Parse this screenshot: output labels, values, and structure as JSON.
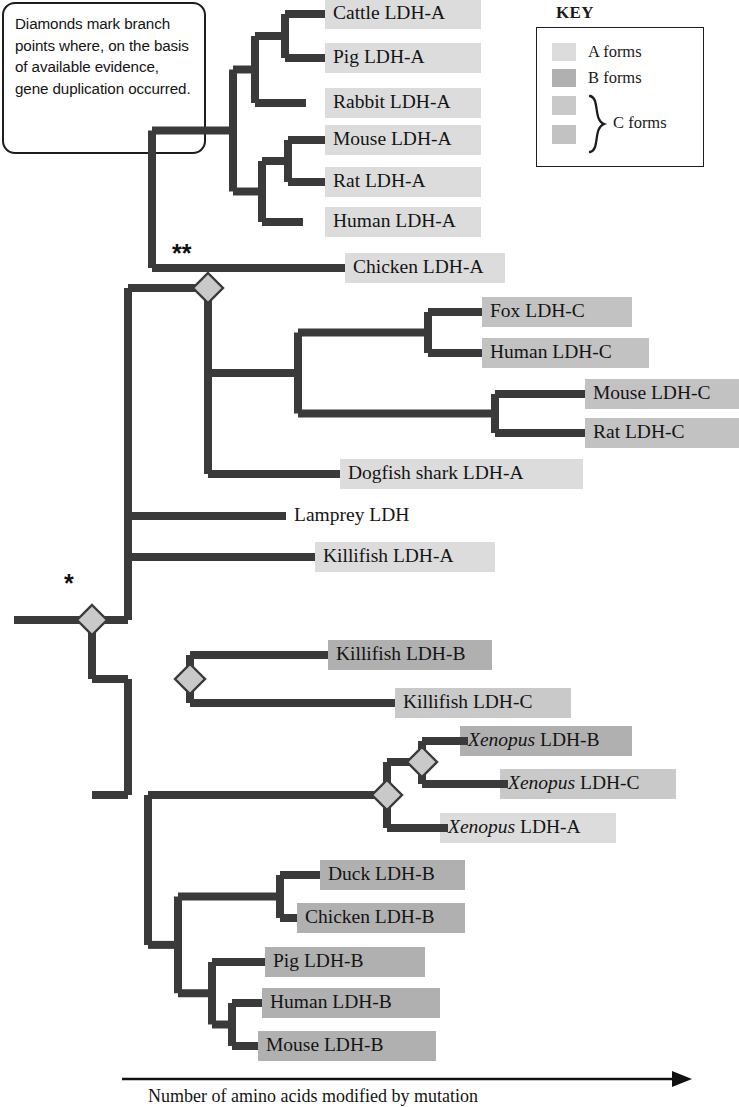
{
  "note": {
    "text": "Diamonds mark branch points where, on the basis of available evidence, gene duplication occurred."
  },
  "key": {
    "title": "KEY",
    "rows": [
      {
        "label": "A forms",
        "color": "#dcdcdc"
      },
      {
        "label": "B forms",
        "color": "#b0b0b0"
      }
    ],
    "c_swatches": [
      {
        "color": "#c9c9c9"
      },
      {
        "color": "#c2c2c2"
      }
    ],
    "c_label": "C forms"
  },
  "axis": {
    "caption": "Number of amino acids modified by mutation"
  },
  "markers": {
    "single_star": "*",
    "double_star": "**"
  },
  "tips": [
    {
      "label": "Cattle LDH-A",
      "form": "A",
      "y": 14,
      "x_branch": 325,
      "bar_x": 325,
      "bar_w": 156,
      "color": "#dcdcdc"
    },
    {
      "label": "Pig LDH-A",
      "form": "A",
      "y": 58,
      "x_branch": 325,
      "bar_x": 325,
      "bar_w": 156,
      "color": "#dcdcdc"
    },
    {
      "label": "Rabbit LDH-A",
      "form": "A",
      "y": 103,
      "x_branch": 306,
      "bar_x": 325,
      "bar_w": 156,
      "color": "#dcdcdc"
    },
    {
      "label": "Mouse LDH-A",
      "form": "A",
      "y": 140,
      "x_branch": 325,
      "bar_x": 325,
      "bar_w": 156,
      "color": "#dcdcdc"
    },
    {
      "label": "Rat LDH-A",
      "form": "A",
      "y": 182,
      "x_branch": 325,
      "bar_x": 325,
      "bar_w": 156,
      "color": "#dcdcdc"
    },
    {
      "label": "Human LDH-A",
      "form": "A",
      "y": 222,
      "x_branch": 303,
      "bar_x": 325,
      "bar_w": 156,
      "color": "#dcdcdc"
    },
    {
      "label": "Chicken LDH-A",
      "form": "A",
      "y": 268,
      "x_branch": 345,
      "bar_x": 345,
      "bar_w": 160,
      "color": "#dcdcdc"
    },
    {
      "label": "Fox LDH-C",
      "form": "C",
      "y": 312,
      "x_branch": 482,
      "bar_x": 482,
      "bar_w": 150,
      "color": "#c2c2c2"
    },
    {
      "label": "Human LDH-C",
      "form": "C",
      "y": 353,
      "x_branch": 482,
      "bar_x": 482,
      "bar_w": 167,
      "color": "#c2c2c2"
    },
    {
      "label": "Mouse LDH-C",
      "form": "C",
      "y": 394,
      "x_branch": 585,
      "bar_x": 585,
      "bar_w": 154,
      "color": "#c2c2c2"
    },
    {
      "label": "Rat LDH-C",
      "form": "C",
      "y": 433,
      "x_branch": 585,
      "bar_x": 585,
      "bar_w": 154,
      "color": "#c2c2c2"
    },
    {
      "label": "Dogfish shark LDH-A",
      "form": "A",
      "y": 474,
      "x_branch": 340,
      "bar_x": 340,
      "bar_w": 243,
      "color": "#dcdcdc"
    },
    {
      "label": "Lamprey LDH",
      "form": "none",
      "y": 516,
      "x_branch": 286,
      "bar_x": 0,
      "bar_w": 0,
      "color": "transparent"
    },
    {
      "label": "Killifish LDH-A",
      "form": "A",
      "y": 557,
      "x_branch": 315,
      "bar_x": 315,
      "bar_w": 180,
      "color": "#dcdcdc"
    },
    {
      "label": "Killifish LDH-B",
      "form": "B",
      "y": 655,
      "x_branch": 328,
      "bar_x": 328,
      "bar_w": 164,
      "color": "#b0b0b0"
    },
    {
      "label": "Killifish LDH-C",
      "form": "C",
      "y": 703,
      "x_branch": 395,
      "bar_x": 395,
      "bar_w": 176,
      "color": "#c9c9c9"
    },
    {
      "label": "Xenopus LDH-B",
      "form": "B",
      "y": 741,
      "x_branch": 468,
      "bar_x": 460,
      "bar_w": 172,
      "color": "#b0b0b0",
      "italic_prefix": "Xenopus",
      "rest": " LDH-B"
    },
    {
      "label": "Xenopus LDH-C",
      "form": "C",
      "y": 784,
      "x_branch": 508,
      "bar_x": 500,
      "bar_w": 176,
      "color": "#c9c9c9",
      "italic_prefix": "Xenopus",
      "rest": " LDH-C"
    },
    {
      "label": "Xenopus LDH-A",
      "form": "A",
      "y": 828,
      "x_branch": 448,
      "bar_x": 440,
      "bar_w": 176,
      "color": "#dcdcdc",
      "italic_prefix": "Xenopus",
      "rest": " LDH-A"
    },
    {
      "label": "Duck LDH-B",
      "form": "B",
      "y": 875,
      "x_branch": 320,
      "bar_x": 320,
      "bar_w": 145,
      "color": "#b0b0b0"
    },
    {
      "label": "Chicken LDH-B",
      "form": "B",
      "y": 918,
      "x_branch": 297,
      "bar_x": 297,
      "bar_w": 168,
      "color": "#b0b0b0"
    },
    {
      "label": "Pig LDH-B",
      "form": "B",
      "y": 962,
      "x_branch": 265,
      "bar_x": 265,
      "bar_w": 160,
      "color": "#b0b0b0"
    },
    {
      "label": "Human LDH-B",
      "form": "B",
      "y": 1003,
      "x_branch": 262,
      "bar_x": 262,
      "bar_w": 178,
      "color": "#b0b0b0"
    },
    {
      "label": "Mouse LDH-B",
      "form": "B",
      "y": 1046,
      "x_branch": 258,
      "bar_x": 258,
      "bar_w": 178,
      "color": "#b0b0b0"
    }
  ],
  "internal_nodes": [
    {
      "name": "root",
      "x": 92,
      "y": 620,
      "diamond": true,
      "star": "*",
      "star_x": 64,
      "star_y": 592
    },
    {
      "name": "a-clade-ancestor",
      "x": 208,
      "y": 288,
      "diamond": true,
      "star": "**",
      "star_x": 172,
      "star_y": 262
    },
    {
      "name": "killifish-bc-dup",
      "x": 190,
      "y": 679,
      "diamond": true
    },
    {
      "name": "xenopus-bc-dup",
      "x": 422,
      "y": 762,
      "diamond": true
    },
    {
      "name": "xenopus-abc-dup",
      "x": 387,
      "y": 795,
      "diamond": true
    }
  ],
  "clades": [
    {
      "name": "cattle-pig"
    },
    {
      "name": "cattle-pig-rabbit"
    },
    {
      "name": "mouse-rat"
    },
    {
      "name": "mouse-rat-human"
    },
    {
      "name": "mammal-ldh-a"
    },
    {
      "name": "ldh-a-amniote"
    },
    {
      "name": "fox-human-c"
    },
    {
      "name": "mouse-rat-c"
    },
    {
      "name": "ldh-c-mammal"
    },
    {
      "name": "upper-clade"
    },
    {
      "name": "killifish-b-c"
    },
    {
      "name": "xenopus-b-c"
    },
    {
      "name": "xenopus-abc"
    },
    {
      "name": "duck-chicken-b"
    },
    {
      "name": "pig-human-mouse-b"
    },
    {
      "name": "human-mouse-b"
    },
    {
      "name": "amniote-b"
    },
    {
      "name": "lower-clade"
    }
  ]
}
